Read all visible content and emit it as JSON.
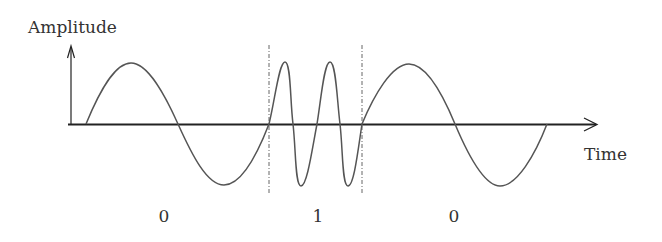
{
  "diagram": {
    "type": "FSK signal (frequency-shift keying)",
    "y_axis_label": "Amplitude",
    "x_axis_label": "Time",
    "bits": [
      {
        "label": "0",
        "frequency": "low",
        "cycles": 1
      },
      {
        "label": "1",
        "frequency": "high",
        "cycles": 2
      },
      {
        "label": "0",
        "frequency": "low",
        "cycles": 1
      }
    ],
    "colors": {
      "axis": "#222222",
      "wave": "#555555",
      "divider": "#666666",
      "text": "#333333"
    }
  }
}
